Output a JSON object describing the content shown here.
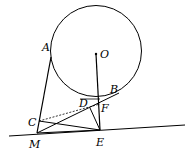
{
  "diagram": {
    "type": "geometry",
    "points": {
      "O": "O",
      "A": "A",
      "B": "B",
      "C": "C",
      "D": "D",
      "F": "F",
      "M": "M",
      "E": "E"
    },
    "elements": [
      "circle O",
      "segment AM",
      "segment OE",
      "segment MB",
      "segment CE",
      "segment DE",
      "dashed segment CF",
      "line through M and E"
    ]
  }
}
